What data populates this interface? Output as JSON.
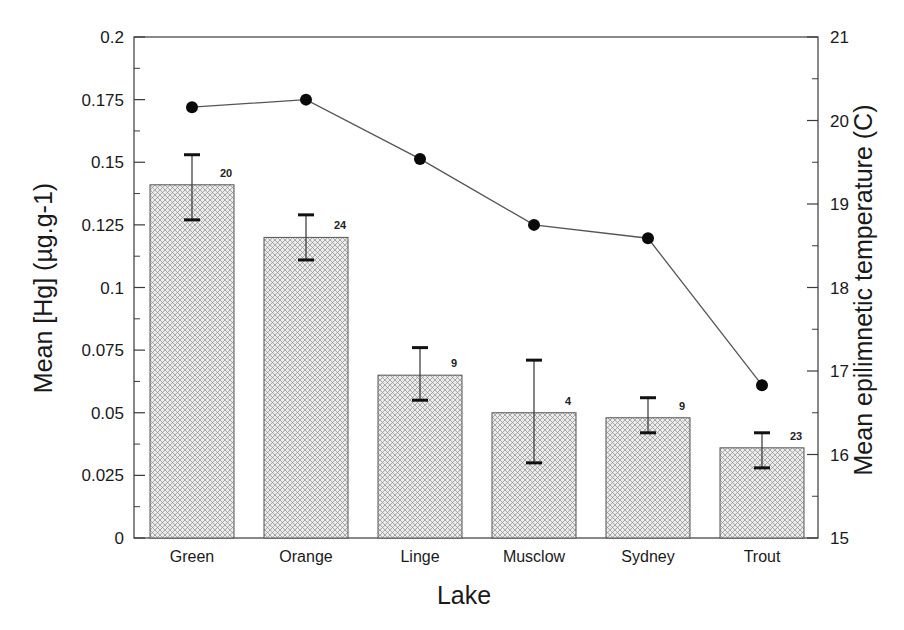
{
  "chart_data": {
    "type": "bar",
    "title": "",
    "xlabel": "Lake",
    "ylabel": "Mean [Hg] (µg.g-1)",
    "y2label": "Mean epilimnetic temperature (C)",
    "categories": [
      "Green",
      "Orange",
      "Linge",
      "Musclow",
      "Sydney",
      "Trout"
    ],
    "ylim": [
      0,
      0.2
    ],
    "y2lim": [
      15,
      21
    ],
    "yticks": [
      "0",
      "0.025",
      "0.05",
      "0.075",
      "0.1",
      "0.125",
      "0.15",
      "0.175",
      "0.2"
    ],
    "y2ticks": [
      "15",
      "16",
      "17",
      "18",
      "19",
      "20",
      "21"
    ],
    "grid": false,
    "legend": null,
    "series": [
      {
        "name": "Mean [Hg]",
        "type": "bar",
        "axis": "left",
        "values": [
          0.141,
          0.12,
          0.065,
          0.05,
          0.048,
          0.036
        ],
        "error_upper": [
          0.153,
          0.129,
          0.076,
          0.071,
          0.056,
          0.042
        ],
        "error_lower": [
          0.127,
          0.111,
          0.055,
          0.03,
          0.042,
          0.028
        ],
        "n_labels": [
          "20",
          "24",
          "9",
          "4",
          "9",
          "23"
        ],
        "pattern": "cross-hatch"
      },
      {
        "name": "Mean epilimnetic temperature",
        "type": "line",
        "axis": "right",
        "marker": "filled-circle",
        "values": [
          20.16,
          20.25,
          19.54,
          18.75,
          18.59,
          16.83
        ]
      }
    ]
  },
  "colors": {
    "axis": "#3a3a3a",
    "bar_fill": "#e6e6e6",
    "bar_hatch": "#8c8c8c",
    "line": "#555555",
    "marker": "#0a0a0a",
    "text": "#1a1a1a"
  }
}
